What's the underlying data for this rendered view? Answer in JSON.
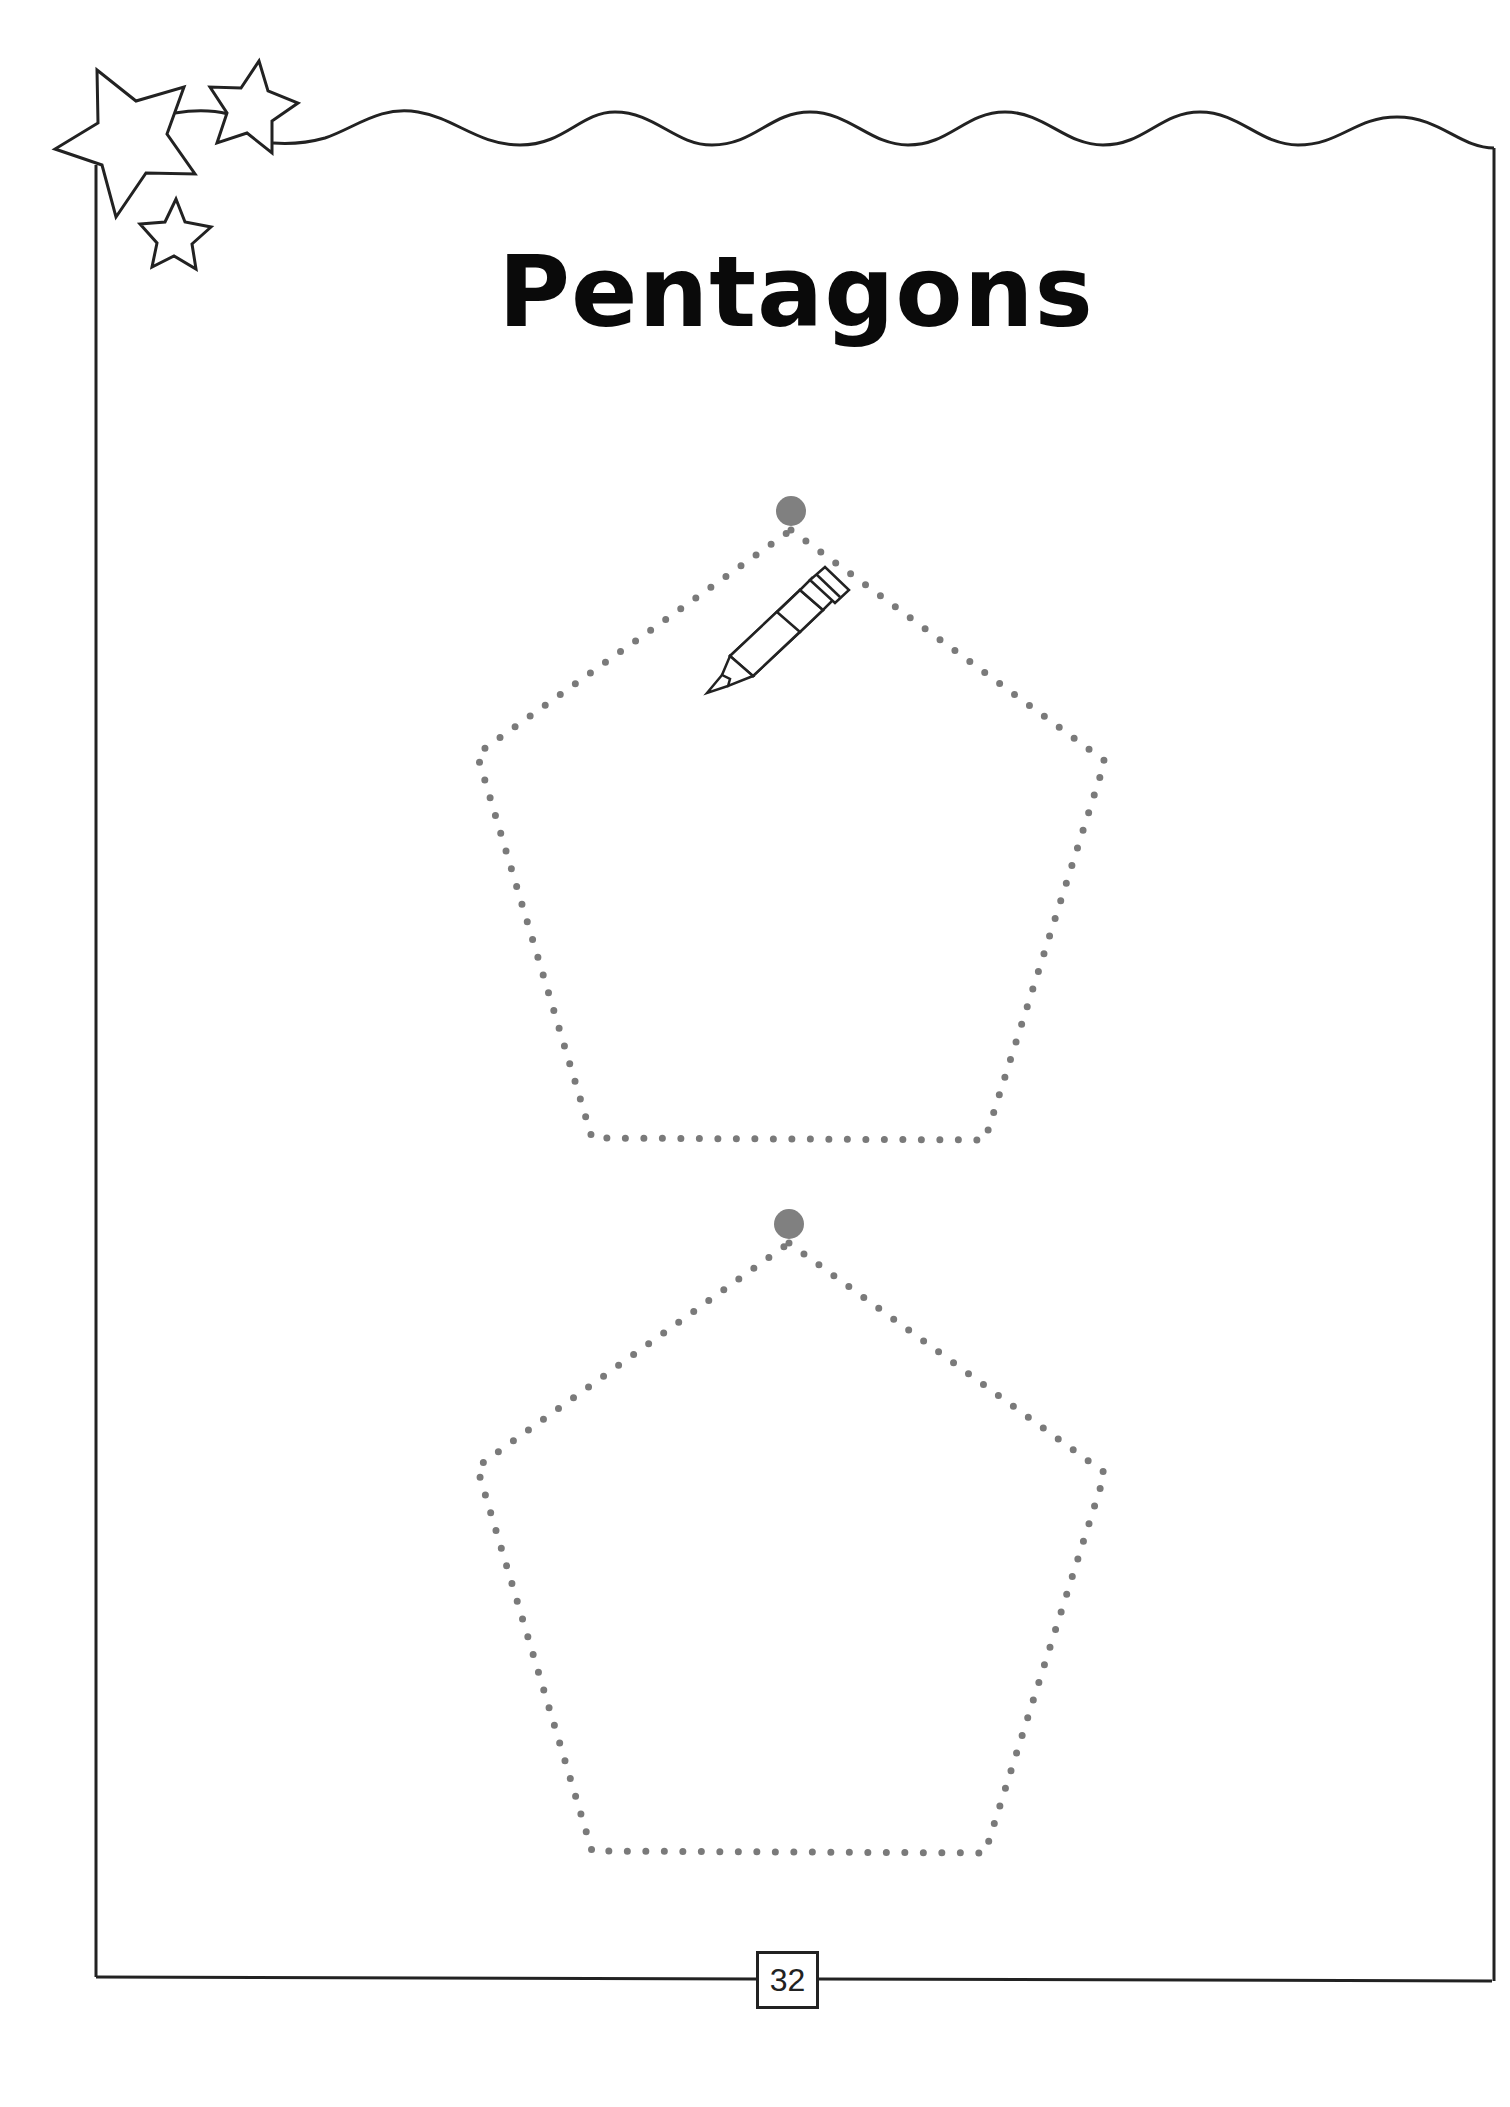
{
  "worksheet": {
    "title": "Pentagons",
    "page_number": "32",
    "shapes": [
      {
        "type": "pentagon",
        "style": "dotted-trace",
        "start_dot": true
      },
      {
        "type": "pentagon",
        "style": "dotted-trace",
        "start_dot": true
      }
    ],
    "decorations": {
      "stars": 3,
      "pencil": "pencil-icon",
      "wavy_border": true
    },
    "colors": {
      "border": "#222222",
      "dots": "#777777",
      "start_dot": "#808080",
      "title": "#0a0a0a"
    }
  }
}
